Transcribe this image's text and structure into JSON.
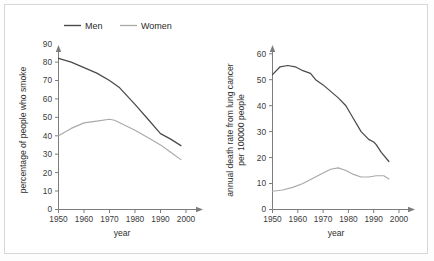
{
  "legend": {
    "position": "top-center",
    "entries": [
      {
        "label": "Men",
        "color": "#4a4a4a",
        "key": "men-legend"
      },
      {
        "label": "Women",
        "color": "#a9a9a9",
        "key": "women-legend"
      }
    ]
  },
  "chart_data": [
    {
      "id": "smoking-chart",
      "type": "line",
      "title": "",
      "xlabel": "year",
      "ylabel": "percentage of people who smoke",
      "xlim": [
        1950,
        2003
      ],
      "ylim": [
        0,
        95
      ],
      "xticks": [
        1950,
        1960,
        1970,
        1980,
        1990,
        2000
      ],
      "xticklabels": [
        "1950",
        "1960",
        "1970",
        "1980",
        "1990",
        "2000"
      ],
      "yticks": [
        0,
        10,
        20,
        30,
        40,
        50,
        60,
        70,
        80,
        90
      ],
      "yticklabels": [
        "0",
        "10",
        "20",
        "30",
        "40",
        "50",
        "60",
        "70",
        "80",
        "90"
      ],
      "grid": false,
      "legend": "shared-top",
      "series": [
        {
          "name": "Men",
          "color": "#4a4a4a",
          "x": [
            1950,
            1955,
            1960,
            1965,
            1970,
            1974,
            1980,
            1985,
            1990,
            1994,
            1998
          ],
          "values": [
            82,
            80,
            77,
            74,
            70,
            66,
            57,
            49,
            41,
            38,
            34.5
          ]
        },
        {
          "name": "Women",
          "color": "#a9a9a9",
          "x": [
            1950,
            1955,
            1960,
            1965,
            1970,
            1972,
            1980,
            1985,
            1990,
            1994,
            1998
          ],
          "values": [
            40,
            44,
            47,
            48,
            49,
            48.5,
            43,
            39,
            35,
            31,
            27
          ]
        }
      ]
    },
    {
      "id": "lung-cancer-chart",
      "type": "line",
      "title": "",
      "xlabel": "year",
      "ylabel": "annual death rate from lung cancer per 100000 people",
      "xlim": [
        1950,
        2003
      ],
      "ylim": [
        0,
        63
      ],
      "xticks": [
        1950,
        1960,
        1970,
        1980,
        1990,
        2000
      ],
      "xticklabels": [
        "1950",
        "1960",
        "1970",
        "1980",
        "1990",
        "2000"
      ],
      "yticks": [
        0,
        10,
        20,
        30,
        40,
        50,
        60
      ],
      "yticklabels": [
        "0",
        "10",
        "20",
        "30",
        "40",
        "50",
        "60"
      ],
      "grid": false,
      "legend": "shared-top",
      "series": [
        {
          "name": "Men",
          "color": "#4a4a4a",
          "x": [
            1950,
            1953,
            1956,
            1959,
            1962,
            1965,
            1967,
            1970,
            1973,
            1976,
            1979,
            1982,
            1985,
            1988,
            1990,
            1991,
            1993,
            1996
          ],
          "values": [
            52,
            55,
            55.5,
            55,
            53.5,
            52.5,
            50,
            48,
            45.5,
            43,
            40,
            35,
            30,
            27,
            26,
            25,
            22,
            18.5
          ]
        },
        {
          "name": "Women",
          "color": "#a9a9a9",
          "x": [
            1950,
            1954,
            1958,
            1962,
            1966,
            1970,
            1973,
            1976,
            1979,
            1982,
            1985,
            1988,
            1991,
            1994,
            1996
          ],
          "values": [
            7,
            7.5,
            8.5,
            10,
            12,
            14,
            15.5,
            16,
            15,
            13.5,
            12.5,
            12.5,
            13,
            13,
            11.8
          ]
        }
      ]
    }
  ]
}
